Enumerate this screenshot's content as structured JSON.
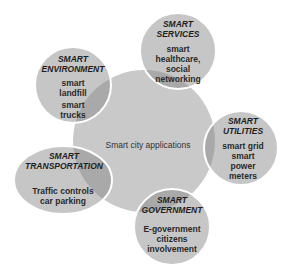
{
  "center": {
    "label": "Smart city applications"
  },
  "nodes": [
    {
      "id": "services",
      "title_lines": [
        "SMART",
        "SERVICES"
      ],
      "body_lines": [
        "smart",
        "healthcare,",
        "social",
        "networking"
      ]
    },
    {
      "id": "environment",
      "title_lines": [
        "SMART",
        "ENVIRONMENT"
      ],
      "body_lines": [
        "smart",
        "landfill",
        "smart",
        "trucks"
      ]
    },
    {
      "id": "utilities",
      "title_lines": [
        "SMART",
        "UTILITIES"
      ],
      "body_lines": [
        "smart grid",
        "smart",
        "power",
        "meters"
      ]
    },
    {
      "id": "transportation",
      "title_lines": [
        "SMART",
        "TRANSPORTATION"
      ],
      "body_lines": [
        "Traffic controls",
        "car parking"
      ]
    },
    {
      "id": "government",
      "title_lines": [
        "SMART",
        "GOVERNMENT"
      ],
      "body_lines": [
        "E-government",
        "citizens",
        "involvement"
      ]
    }
  ],
  "colors": {
    "center_fill": "#c9c9c9",
    "node_fill": "#c6c6c6",
    "overlap_fill": "#a9a9a9",
    "border": "#ffffff"
  }
}
